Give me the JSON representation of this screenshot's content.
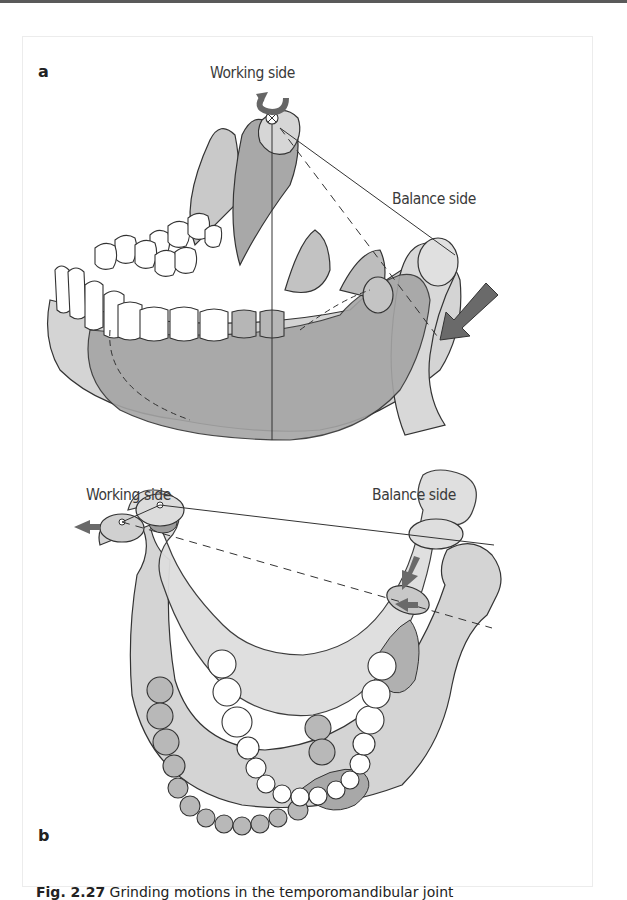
{
  "figure": {
    "panels": [
      {
        "id": "a",
        "label": "a",
        "annotations": {
          "working_side": "Working side",
          "balance_side": "Balance side"
        }
      },
      {
        "id": "b",
        "label": "b",
        "annotations": {
          "working_side": "Working side",
          "balance_side": "Balance side"
        }
      }
    ],
    "caption": {
      "number": "Fig. 2.27",
      "text": "Grinding motions in the temporomandibular joint"
    },
    "colors": {
      "light_fill": "#d9d9d9",
      "mid_fill": "#b3b3b3",
      "dark_fill": "#9a9a9a",
      "outline": "#333333",
      "arrow": "#6b6b6b",
      "tooth": "#ffffff"
    }
  }
}
